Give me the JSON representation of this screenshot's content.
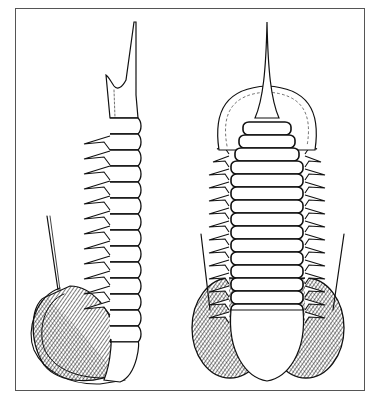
{
  "figure": {
    "frame": {
      "x": 15,
      "y": 8,
      "w": 350,
      "h": 383,
      "border_color": "#555555"
    },
    "ink_color": "#111111",
    "hatch_color": "#222222",
    "left_view": {
      "label": "lateral-view",
      "spine_top": [
        131,
        22
      ],
      "spine_base": [
        125,
        100
      ],
      "axis_x": [
        110,
        138
      ],
      "segments_top": 118,
      "segment_count": 14,
      "segment_height": 16,
      "pleural_spines": 12,
      "eye": {
        "cx": 75,
        "cy": 330,
        "rx": 40,
        "ry": 55
      }
    },
    "right_view": {
      "label": "dorsal-view",
      "spine_top": [
        267,
        22
      ],
      "head": {
        "cx": 267,
        "cy": 118,
        "rx": 50,
        "ry": 36
      },
      "axis_left": 229,
      "axis_right": 305,
      "segments_top": 122,
      "segment_count": 15,
      "segment_height": 13,
      "pygidium": {
        "cx": 267,
        "cy": 343,
        "rx": 36,
        "ry": 35
      },
      "eyes": [
        {
          "cx": 230,
          "cy": 328,
          "rx": 38,
          "ry": 50
        },
        {
          "cx": 306,
          "cy": 328,
          "rx": 38,
          "ry": 50
        }
      ],
      "antennae": [
        [
          201,
          234,
          210,
          310
        ],
        [
          344,
          234,
          333,
          310
        ]
      ]
    }
  }
}
